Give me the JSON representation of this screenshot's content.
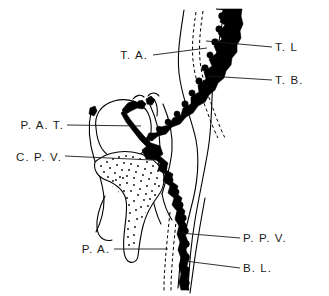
{
  "figure": {
    "type": "anatomical-line-diagram",
    "background_color": "#ffffff",
    "ink_color": "#000000",
    "width": 329,
    "height": 296
  },
  "labels": [
    {
      "id": "t-a",
      "text": "T. A.",
      "full_name": "Terminal Arteriole",
      "side": "left",
      "text_x": 148,
      "text_y": 59,
      "leader": {
        "x1": 153,
        "y1": 55,
        "x2": 207,
        "y2": 48
      }
    },
    {
      "id": "t-l",
      "text": "T. L",
      "full_name": "Terminal Lymphatic",
      "side": "right",
      "text_x": 275,
      "text_y": 51,
      "leader": {
        "x1": 272,
        "y1": 47,
        "x2": 206,
        "y2": 41
      }
    },
    {
      "id": "t-b",
      "text": "T. B.",
      "full_name": "Terminal Bronchiole",
      "side": "right",
      "text_x": 275,
      "text_y": 84,
      "leader": {
        "x1": 272,
        "y1": 80,
        "x2": 208,
        "y2": 76
      }
    },
    {
      "id": "p-a-t",
      "text": "P. A. T.",
      "full_name": "Pulmonary Arterial Trunk",
      "side": "left",
      "text_x": 64,
      "text_y": 129,
      "leader": {
        "x1": 67,
        "y1": 125,
        "x2": 141,
        "y2": 126
      }
    },
    {
      "id": "c-p-v",
      "text": "C. P. V.",
      "full_name": "Central Pulmonary Vein",
      "side": "left",
      "text_x": 62,
      "text_y": 161,
      "leader": {
        "x1": 65,
        "y1": 156,
        "x2": 152,
        "y2": 160
      }
    },
    {
      "id": "p-a",
      "text": "P. A.",
      "full_name": "Pulmonary Artery",
      "side": "left",
      "text_x": 110,
      "text_y": 253,
      "leader": {
        "x1": 114,
        "y1": 249,
        "x2": 168,
        "y2": 249
      }
    },
    {
      "id": "p-p-v",
      "text": "P. P. V.",
      "full_name": "Peripheral Pulmonary Vein",
      "side": "right",
      "text_x": 243,
      "text_y": 242,
      "leader": {
        "x1": 240,
        "y1": 238,
        "x2": 180,
        "y2": 233
      }
    },
    {
      "id": "b-l",
      "text": "B. L.",
      "full_name": "Bronchial Lumen",
      "side": "right",
      "text_x": 243,
      "text_y": 272,
      "leader": {
        "x1": 240,
        "y1": 268,
        "x2": 185,
        "y2": 261
      }
    }
  ],
  "structures": [
    {
      "id": "terminal-lymphatic-vessel",
      "style": "thick-black-jagged",
      "description": "Main beaded dark vessel running top-right to bottom-right through Y junction"
    },
    {
      "id": "terminal-arteriole-dashed",
      "style": "dashed-line",
      "description": "Dashed arteriole paralleling the lymphatic in upper region"
    },
    {
      "id": "terminal-bronchiole-wall",
      "style": "thin-outline",
      "description": "Outer curving tube wall on the right"
    },
    {
      "id": "alveolar-duct-oval",
      "style": "thin-outline-oval",
      "description": "Rounded air space left of center"
    },
    {
      "id": "stippled-septum",
      "style": "stippled-region",
      "description": "Dotted connective tissue septum extending down-left"
    },
    {
      "id": "pulmonary-artery-dashed-lower",
      "style": "dashed-line",
      "description": "Dashed artery in lower region"
    },
    {
      "id": "bronchial-lumen-line",
      "style": "thin-outline",
      "description": "Thin outline on far right lower region"
    }
  ]
}
